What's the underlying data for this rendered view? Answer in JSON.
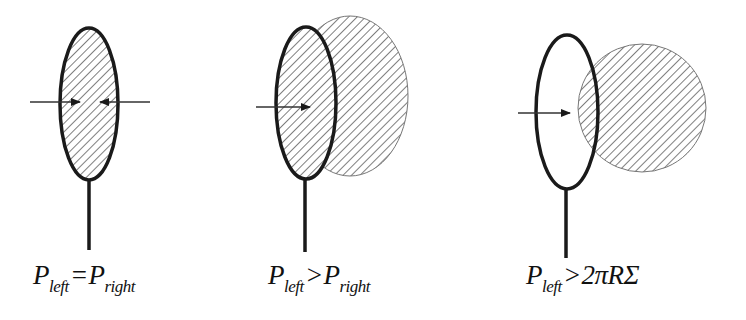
{
  "panels": [
    {
      "id": "equal-pressure",
      "label": {
        "p1": "P",
        "s1": "left",
        "op": "=",
        "p2": "P",
        "s2": "right"
      }
    },
    {
      "id": "bulging-membrane",
      "label": {
        "p1": "P",
        "s1": "left",
        "op": ">",
        "p2": "P",
        "s2": "right"
      }
    },
    {
      "id": "bubble-detach",
      "label": {
        "p1": "P",
        "s1": "left",
        "op": ">",
        "p2": "2πRΣ",
        "s2": ""
      }
    }
  ],
  "colors": {
    "outline": "#1a1a1a",
    "hatch": "#666666",
    "thin_stroke": "#777777",
    "background": "#ffffff"
  }
}
